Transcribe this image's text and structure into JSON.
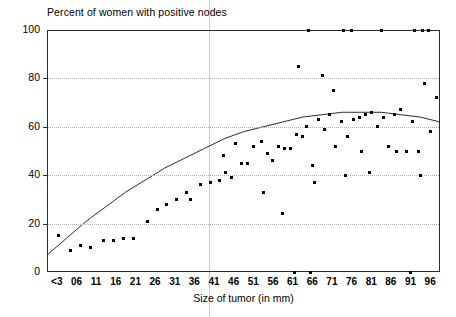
{
  "chart_data": {
    "type": "scatter",
    "title": "Percent of women with positive nodes",
    "xlabel": "Size of tumor (in mm)",
    "ylabel": "",
    "xlim": [
      0,
      20
    ],
    "ylim": [
      0,
      100
    ],
    "grid": true,
    "legend": null,
    "x_tick_labels": [
      "<3",
      "06",
      "11",
      "16",
      "21",
      "26",
      "31",
      "36",
      "41",
      "46",
      "51",
      "56",
      "61",
      "66",
      "71",
      "76",
      "81",
      "86",
      "91",
      "96"
    ],
    "y_tick_labels": [
      "0",
      "20",
      "40",
      "60",
      "80",
      "100"
    ],
    "y_ticks": [
      0,
      20,
      40,
      60,
      80,
      100
    ],
    "gridlines_y": [
      20,
      40,
      60,
      80
    ],
    "reference_line": {
      "x_mm": 43.5,
      "orientation": "vertical",
      "color": "#c9c9c9"
    },
    "point_color": "#000000",
    "curve_color": "#2b2b2b",
    "series": [
      {
        "name": "Observed percent positive nodes",
        "points": [
          [
            0.6,
            15
          ],
          [
            1.2,
            9
          ],
          [
            1.7,
            11
          ],
          [
            2.2,
            10
          ],
          [
            2.9,
            13
          ],
          [
            3.4,
            13
          ],
          [
            3.9,
            14
          ],
          [
            4.4,
            14
          ],
          [
            5.1,
            21
          ],
          [
            5.6,
            26
          ],
          [
            6.1,
            28
          ],
          [
            6.6,
            30
          ],
          [
            7.1,
            33
          ],
          [
            7.3,
            30
          ],
          [
            7.8,
            36
          ],
          [
            8.3,
            37
          ],
          [
            8.8,
            38
          ],
          [
            9.1,
            41
          ],
          [
            9.4,
            39
          ],
          [
            9.9,
            45
          ],
          [
            10.2,
            45
          ],
          [
            10.5,
            52
          ],
          [
            10.9,
            54
          ],
          [
            11.2,
            49
          ],
          [
            11.5,
            46
          ],
          [
            11.8,
            52
          ],
          [
            12.1,
            51
          ],
          [
            12.4,
            51
          ],
          [
            12.7,
            57
          ],
          [
            13.0,
            56
          ],
          [
            13.2,
            60
          ],
          [
            13.5,
            44
          ],
          [
            11.0,
            33
          ],
          [
            12.0,
            24
          ],
          [
            9.0,
            48
          ],
          [
            9.6,
            53
          ],
          [
            13.8,
            63
          ],
          [
            14.1,
            59
          ],
          [
            14.4,
            65
          ],
          [
            14.7,
            52
          ],
          [
            15.0,
            62
          ],
          [
            15.3,
            56
          ],
          [
            15.6,
            63
          ],
          [
            15.9,
            64
          ],
          [
            16.2,
            65
          ],
          [
            16.5,
            66
          ],
          [
            16.8,
            60
          ],
          [
            17.1,
            64
          ],
          [
            17.4,
            52
          ],
          [
            17.7,
            65
          ],
          [
            18.0,
            67
          ],
          [
            18.3,
            50
          ],
          [
            18.6,
            62
          ],
          [
            18.9,
            50
          ],
          [
            19.2,
            78
          ],
          [
            19.5,
            58
          ],
          [
            19.8,
            72
          ],
          [
            14.0,
            81
          ],
          [
            14.6,
            75
          ],
          [
            16.0,
            50
          ],
          [
            16.4,
            41
          ],
          [
            15.2,
            40
          ],
          [
            13.6,
            37
          ],
          [
            17.8,
            50
          ],
          [
            19.0,
            40
          ],
          [
            12.8,
            85
          ],
          [
            13.3,
            100
          ],
          [
            15.1,
            100
          ],
          [
            15.5,
            100
          ],
          [
            17.0,
            100
          ],
          [
            18.7,
            100
          ],
          [
            19.1,
            100
          ],
          [
            19.4,
            100
          ],
          [
            12.6,
            0
          ],
          [
            13.4,
            0
          ],
          [
            18.5,
            0
          ]
        ]
      }
    ],
    "fit_curve": {
      "name": "Fitted quadratic trend",
      "points": [
        [
          0.0,
          7
        ],
        [
          1.0,
          14
        ],
        [
          2.0,
          21
        ],
        [
          3.0,
          27
        ],
        [
          4.0,
          33
        ],
        [
          5.0,
          38
        ],
        [
          6.0,
          43
        ],
        [
          7.0,
          47
        ],
        [
          8.0,
          51
        ],
        [
          9.0,
          55
        ],
        [
          10.0,
          58
        ],
        [
          11.0,
          60
        ],
        [
          12.0,
          62
        ],
        [
          13.0,
          64
        ],
        [
          14.0,
          65
        ],
        [
          15.0,
          66
        ],
        [
          16.0,
          66
        ],
        [
          17.0,
          66
        ],
        [
          18.0,
          65
        ],
        [
          19.0,
          64
        ],
        [
          20.0,
          62
        ]
      ]
    }
  }
}
